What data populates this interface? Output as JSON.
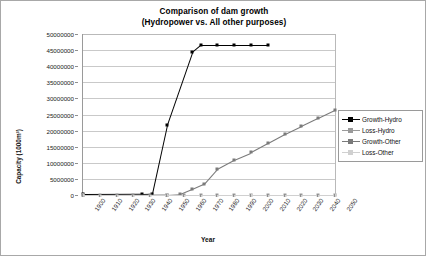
{
  "chart_data": {
    "type": "line",
    "title": "Comparison of dam growth",
    "subtitle": "(Hydropower vs. All other purposes)",
    "xlabel": "Year",
    "ylabel": "Capacity (1000m³)",
    "xlim": [
      1900,
      2050
    ],
    "ylim": [
      0,
      50000000
    ],
    "ytick_step": 5000000,
    "xtick_step": 10,
    "grid": "horizontal",
    "legend_position": "right",
    "categories": [
      1900,
      1910,
      1920,
      1930,
      1940,
      1950,
      1960,
      1970,
      1980,
      1990,
      2000,
      2010,
      2020,
      2030,
      2040,
      2050
    ],
    "ytick_labels": [
      "0",
      "5000000",
      "10000000",
      "15000000",
      "20000000",
      "25000000",
      "30000000",
      "35000000",
      "40000000",
      "45000000",
      "50000000"
    ],
    "xtick_labels": [
      "1900",
      "1910",
      "1920",
      "1930",
      "1940",
      "1950",
      "1960",
      "1970",
      "1980",
      "1990",
      "2000",
      "2010",
      "2020",
      "2030",
      "2040",
      "2050"
    ],
    "series": [
      {
        "name": "Growth-Hydro",
        "color": "#000000",
        "marker": "square",
        "points": [
          [
            1900,
            200000
          ],
          [
            1935,
            250000
          ],
          [
            1941,
            300000
          ],
          [
            1950,
            21800000
          ],
          [
            1965,
            44300000
          ],
          [
            1970,
            46500000
          ],
          [
            1980,
            46500000
          ],
          [
            1990,
            46500000
          ],
          [
            2000,
            46500000
          ],
          [
            2010,
            46500000
          ]
        ]
      },
      {
        "name": "Loss-Hydro",
        "color": "#9a9a9a",
        "marker": "square",
        "points": [
          [
            1900,
            0
          ],
          [
            1910,
            0
          ],
          [
            1920,
            0
          ],
          [
            1930,
            0
          ],
          [
            1940,
            0
          ],
          [
            1950,
            0
          ],
          [
            1960,
            0
          ],
          [
            1970,
            0
          ],
          [
            1980,
            0
          ],
          [
            1990,
            0
          ],
          [
            2000,
            0
          ],
          [
            2010,
            0
          ],
          [
            2020,
            0
          ],
          [
            2030,
            0
          ],
          [
            2040,
            0
          ],
          [
            2050,
            0
          ]
        ]
      },
      {
        "name": "Growth-Other",
        "color": "#7a7a7a",
        "marker": "square",
        "points": [
          [
            1900,
            0
          ],
          [
            1950,
            120000
          ],
          [
            1958,
            400000
          ],
          [
            1965,
            1900000
          ],
          [
            1972,
            3500000
          ],
          [
            1980,
            8200000
          ],
          [
            1990,
            11000000
          ],
          [
            2000,
            13200000
          ],
          [
            2010,
            16000000
          ],
          [
            2020,
            18800000
          ],
          [
            2030,
            21300000
          ],
          [
            2040,
            23800000
          ],
          [
            2050,
            26300000
          ]
        ]
      },
      {
        "name": "Loss-Other",
        "color": "#d0d0d0",
        "marker": "square",
        "points": [
          [
            1900,
            0
          ],
          [
            1950,
            0
          ],
          [
            2000,
            0
          ],
          [
            2050,
            0
          ]
        ]
      }
    ]
  },
  "legend": {
    "items": [
      {
        "label": "Growth-Hydro",
        "color": "#000000"
      },
      {
        "label": "Loss-Hydro",
        "color": "#9a9a9a"
      },
      {
        "label": "Growth-Other",
        "color": "#7a7a7a"
      },
      {
        "label": "Loss-Other",
        "color": "#d0d0d0"
      }
    ]
  }
}
